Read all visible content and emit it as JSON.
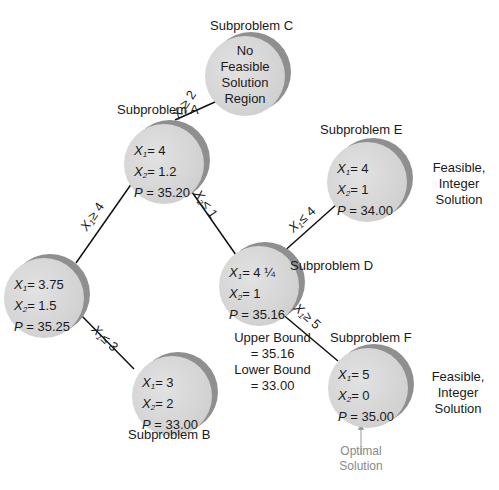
{
  "nodes": {
    "C": {
      "title": "Subproblem C",
      "lines": [
        "No",
        "Feasible",
        "Solution",
        "Region"
      ]
    },
    "A": {
      "title": "Subproblem A",
      "x1": "4",
      "x2": "1.2",
      "p": "35.20"
    },
    "E": {
      "title": "Subproblem E",
      "x1": "4",
      "x2": "1",
      "p": "34.00",
      "note": [
        "Feasible, Integer",
        "Solution"
      ]
    },
    "L": {
      "title": "",
      "x1": "3.75",
      "x2": "1.5",
      "p": "35.25"
    },
    "D": {
      "title": "Subproblem D",
      "x1": "4 ¼",
      "x2": "1",
      "p": "35.16",
      "bounds": [
        "Upper Bound",
        "= 35.16",
        "Lower Bound",
        "= 33.00"
      ]
    },
    "B": {
      "title": "Subproblem B",
      "x1": "3",
      "x2": "2",
      "p": "33.00"
    },
    "F": {
      "title": "Subproblem F",
      "x1": "5",
      "x2": "0",
      "p": "35.00",
      "note": [
        "Feasible, Integer",
        "Solution"
      ],
      "optimal": [
        "Optimal",
        "Solution"
      ]
    }
  },
  "branches": {
    "A_C": {
      "var": "X",
      "sub": "2",
      "op": "≥ 2"
    },
    "A_L": {
      "var": "X",
      "sub": "1",
      "op": "≥ 4"
    },
    "A_D": {
      "var": "X",
      "sub": "2",
      "op": "≤ 1"
    },
    "D_E": {
      "var": "X",
      "sub": "1",
      "op": "≤ 4"
    },
    "D_F": {
      "var": "X",
      "sub": "1",
      "op": "≥ 5"
    },
    "L_B": {
      "var": "X",
      "sub": "1",
      "op": "≤ 3"
    }
  },
  "labels": {
    "x1": "X",
    "x1_sub": "1",
    "x2": "X",
    "x2_sub": "2",
    "p": "P",
    "eq": "= "
  }
}
